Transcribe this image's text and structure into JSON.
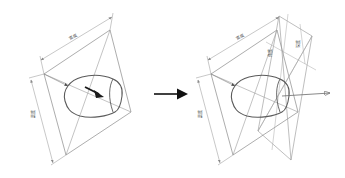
{
  "figure": {
    "title": "",
    "background_color": "#ffffff",
    "line_color": "#8a8a8a",
    "blob_color": "#5a5a5a",
    "accent_color": "#1a1a1a",
    "panel_count": 2
  },
  "transition_arrow": {
    "name": "transition-arrow",
    "direction": "right",
    "color": "#111111"
  },
  "left_panel": {
    "name": "left-diagram",
    "caption": "",
    "dim_width_label": "宽度",
    "dim_height_label": "高度",
    "blob_label": "",
    "inner_arrow": {
      "name": "inner-bold-arrow",
      "direction": "right-down",
      "color": "#1a1a1a"
    },
    "plane_count": 1
  },
  "right_panel": {
    "name": "right-diagram",
    "caption": "",
    "dim_width_label": "宽度",
    "dim_height_label": "高度",
    "dim_tilt_label": "角度",
    "dim_depth_label": "深度",
    "outgoing_arrow": {
      "name": "outgoing-thin-arrow",
      "direction": "right",
      "color": "#6a6a6a"
    },
    "plane_count": 2
  }
}
